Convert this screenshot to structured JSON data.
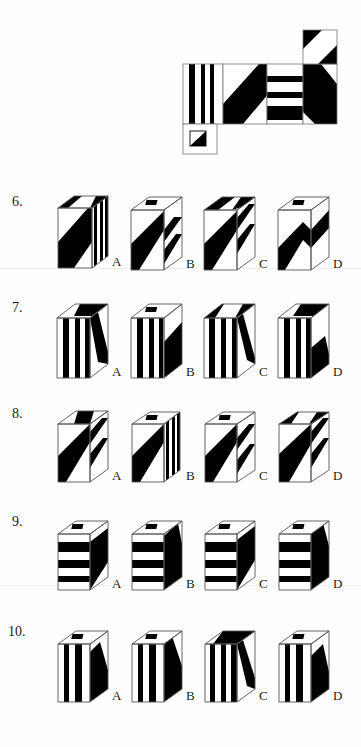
{
  "page": {
    "background_color": "#ffffff",
    "ink_color": "#000000"
  },
  "net": {
    "caption": "",
    "description": "Unfolded net of a box shown at top of page",
    "panels": [
      {
        "id": "panel-vertical-stripes",
        "pattern": "vertical-stripes",
        "x": 183,
        "y": 64,
        "w": 40,
        "h": 60
      },
      {
        "id": "panel-diagonal-band",
        "pattern": "diagonal-band",
        "x": 223,
        "y": 64,
        "w": 44,
        "h": 60
      },
      {
        "id": "panel-horizontal-stripes",
        "pattern": "horizontal-stripes",
        "x": 267,
        "y": 64,
        "w": 36,
        "h": 60
      },
      {
        "id": "panel-diagonal-corner",
        "pattern": "diagonal-corner",
        "x": 303,
        "y": 64,
        "w": 34,
        "h": 60
      },
      {
        "id": "panel-top-corner",
        "pattern": "double-corner",
        "x": 303,
        "y": 30,
        "w": 34,
        "h": 34
      },
      {
        "id": "panel-small-square",
        "pattern": "small-corner-square",
        "x": 183,
        "y": 124,
        "w": 34,
        "h": 30
      }
    ]
  },
  "questions": [
    {
      "number": "6.",
      "options": [
        {
          "letter": "A",
          "pattern": "diagonal-front-stripes-side"
        },
        {
          "letter": "B",
          "pattern": "diagonal-front-diagonal-side-hole"
        },
        {
          "letter": "C",
          "pattern": "diagonal-front-diagonal-side"
        },
        {
          "letter": "D",
          "pattern": "chevron-front-hole"
        }
      ]
    },
    {
      "number": "7.",
      "options": [
        {
          "letter": "A",
          "pattern": "vertical-stripes-front-diagonal-side"
        },
        {
          "letter": "B",
          "pattern": "vertical-stripes-front-black-side-hole"
        },
        {
          "letter": "C",
          "pattern": "vertical-stripes-front-diagonal-side-dark-top"
        },
        {
          "letter": "D",
          "pattern": "vertical-stripes-front-wedge-side"
        }
      ]
    },
    {
      "number": "8.",
      "options": [
        {
          "letter": "A",
          "pattern": "diagonal-band-front-diagonal-stripes-side"
        },
        {
          "letter": "B",
          "pattern": "diagonal-band-front-vertical-stripes-side-hole"
        },
        {
          "letter": "C",
          "pattern": "diagonal-band-front-diagonal-stripes-side-hole"
        },
        {
          "letter": "D",
          "pattern": "diagonal-band-front-diagonal-stripes-side-dark-top"
        }
      ]
    },
    {
      "number": "9.",
      "options": [
        {
          "letter": "A",
          "pattern": "horizontal-stripes-front-wedge-side-hole"
        },
        {
          "letter": "B",
          "pattern": "horizontal-stripes-front-black-side-hole"
        },
        {
          "letter": "C",
          "pattern": "horizontal-stripes-front-wedge-side-hole-2"
        },
        {
          "letter": "D",
          "pattern": "horizontal-stripes-front-black-side-hole-2"
        }
      ]
    },
    {
      "number": "10.",
      "options": [
        {
          "letter": "A",
          "pattern": "vertical-stripes-front-wedge-side-hole"
        },
        {
          "letter": "B",
          "pattern": "vertical-stripes-front-black-side-hole"
        },
        {
          "letter": "C",
          "pattern": "vertical-stripes-front-black-side-dark-top"
        },
        {
          "letter": "D",
          "pattern": "vertical-stripes-front-wedge-side-hole-2"
        }
      ]
    }
  ]
}
